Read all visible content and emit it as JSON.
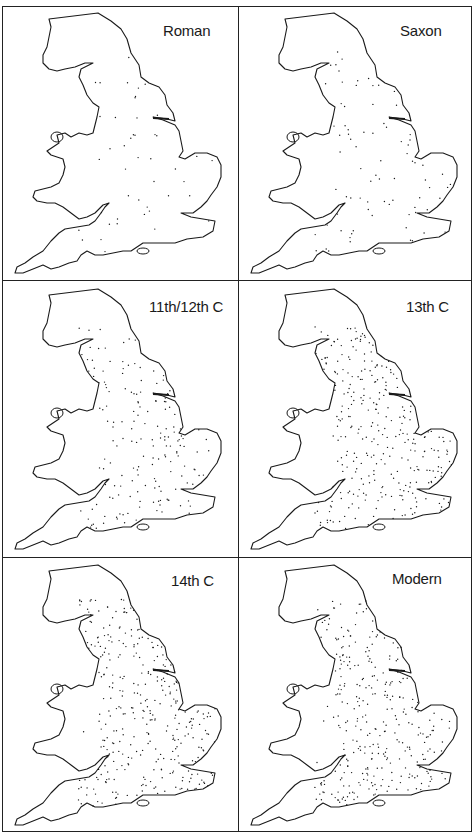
{
  "figure": {
    "panels": [
      {
        "label": "Roman",
        "dot_count": 45,
        "position": "top-left"
      },
      {
        "label": "Saxon",
        "dot_count": 80,
        "position": "top-right"
      },
      {
        "label": "11th/12th C",
        "dot_count": 170,
        "position": "middle-left"
      },
      {
        "label": "13th C",
        "dot_count": 300,
        "position": "middle-right"
      },
      {
        "label": "14th C",
        "dot_count": 330,
        "position": "bottom-left"
      },
      {
        "label": "Modern",
        "dot_count": 310,
        "position": "bottom-right"
      }
    ],
    "colors": {
      "ink": "#1a1a1a",
      "background": "#ffffff"
    }
  }
}
